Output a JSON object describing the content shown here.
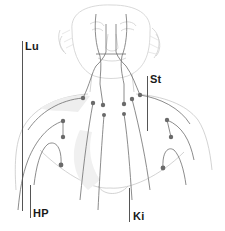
{
  "diagram": {
    "type": "anatomical-meridian-chart",
    "line_color": "#6e6e6e",
    "point_color": "#6a6a6a",
    "sketch_color": "#c9c9c9",
    "labels": [
      {
        "id": "lu",
        "text": "Lu",
        "x": 24,
        "y": 41
      },
      {
        "id": "st",
        "text": "St",
        "x": 150,
        "y": 74
      },
      {
        "id": "hp",
        "text": "HP",
        "x": 33,
        "y": 208
      },
      {
        "id": "ki",
        "text": "Ki",
        "x": 133,
        "y": 211
      }
    ],
    "points": [
      {
        "x": 83,
        "y": 98
      },
      {
        "x": 93,
        "y": 103
      },
      {
        "x": 103,
        "y": 105
      },
      {
        "x": 124,
        "y": 104
      },
      {
        "x": 132,
        "y": 99
      },
      {
        "x": 140,
        "y": 95
      },
      {
        "x": 104,
        "y": 115
      },
      {
        "x": 124,
        "y": 114
      },
      {
        "x": 63,
        "y": 121
      },
      {
        "x": 63,
        "y": 137
      },
      {
        "x": 167,
        "y": 120
      },
      {
        "x": 171,
        "y": 137
      },
      {
        "x": 61,
        "y": 165
      },
      {
        "x": 163,
        "y": 168
      }
    ]
  }
}
